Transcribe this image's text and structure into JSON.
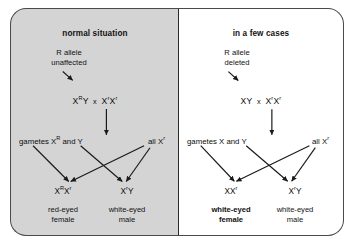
{
  "figure": {
    "background_color": "#ffffff"
  },
  "panels": [
    {
      "id": "normal",
      "title": "normal situation",
      "background_color": "#d4d4d4",
      "annotation": "R allele\nunaffected",
      "annotation_line1": "R allele",
      "annotation_line2": "unaffected",
      "cross": {
        "father_base": "X",
        "father_sup": "R",
        "father_tail": "Y",
        "times": "x",
        "mother_base1": "X",
        "mother_sup1": "r",
        "mother_base2": "X",
        "mother_sup2": "r"
      },
      "gametes_left_prefix": "gametes X",
      "gametes_left_sup": "R",
      "gametes_left_suffix": " and Y",
      "gametes_right_prefix": "all X",
      "gametes_right_sup": "r",
      "offspring": [
        {
          "genotype_parts": [
            "X",
            "R",
            "X",
            "r"
          ],
          "phenotype_line1": "red-eyed",
          "phenotype_line2": "female",
          "bold": false
        },
        {
          "genotype_parts": [
            "X",
            "r",
            "Y",
            ""
          ],
          "phenotype_line1": "white-eyed",
          "phenotype_line2": "male",
          "bold": false
        }
      ]
    },
    {
      "id": "deleted",
      "title": "in a few cases",
      "background_color": "#ffffff",
      "annotation": "R allele\ndeleted",
      "annotation_line1": "R allele",
      "annotation_line2": "deleted",
      "cross": {
        "father_base": "X",
        "father_sup": "",
        "father_tail": "Y",
        "times": "x",
        "mother_base1": "X",
        "mother_sup1": "r",
        "mother_base2": "X",
        "mother_sup2": "r"
      },
      "gametes_left_prefix": "gametes X",
      "gametes_left_sup": "",
      "gametes_left_suffix": " and Y",
      "gametes_right_prefix": "all X",
      "gametes_right_sup": "r",
      "offspring": [
        {
          "genotype_parts": [
            "X",
            "",
            "X",
            "r"
          ],
          "phenotype_line1": "white-eyed",
          "phenotype_line2": "female",
          "bold": true
        },
        {
          "genotype_parts": [
            "X",
            "r",
            "Y",
            ""
          ],
          "phenotype_line1": "white-eyed",
          "phenotype_line2": "male",
          "bold": false
        }
      ]
    }
  ],
  "colors": {
    "line": "#1a1a1a",
    "text": "#121212",
    "panel_border": "#4a4a4a",
    "divider": "#2b2b2b"
  }
}
